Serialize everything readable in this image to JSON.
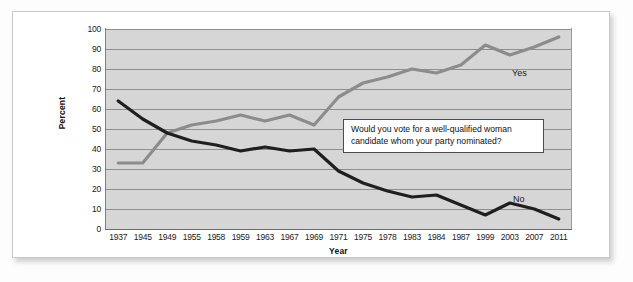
{
  "chart_data": {
    "type": "line",
    "title": "",
    "xlabel": "Year",
    "ylabel": "Percent",
    "ylim": [
      0,
      100
    ],
    "ytick_step": 10,
    "yticks": [
      100,
      90,
      80,
      70,
      60,
      50,
      40,
      30,
      20,
      10,
      0
    ],
    "grid": true,
    "legend_position": "inline-end-of-line",
    "annotation": {
      "line1": "Would you vote for a well-qualified woman",
      "line2": "candidate whom your party nominated?"
    },
    "categories": [
      "1937",
      "1945",
      "1949",
      "1955",
      "1958",
      "1959",
      "1963",
      "1967",
      "1969",
      "1971",
      "1975",
      "1978",
      "1983",
      "1984",
      "1987",
      "1999",
      "2003",
      "2007",
      "2011"
    ],
    "series": [
      {
        "name": "Yes",
        "color": "#8c8c8c",
        "values": [
          33,
          33,
          48,
          52,
          54,
          57,
          54,
          57,
          52,
          66,
          73,
          76,
          80,
          78,
          82,
          92,
          87,
          91,
          96
        ]
      },
      {
        "name": "No",
        "color": "#1f1f1f",
        "values": [
          64,
          55,
          48,
          44,
          42,
          39,
          41,
          39,
          40,
          29,
          23,
          19,
          16,
          17,
          12,
          7,
          13,
          10,
          5
        ]
      }
    ],
    "colors": {
      "plot_background": "#d6d6d6",
      "gridline": "#8f8f8f",
      "card_background": "#ffffff",
      "card_border": "#c9c9c9",
      "yes_line": "#8c8c8c",
      "no_line": "#1f1f1f",
      "annotation_border": "#4c4c4c",
      "text": "#1a1a1a"
    }
  }
}
